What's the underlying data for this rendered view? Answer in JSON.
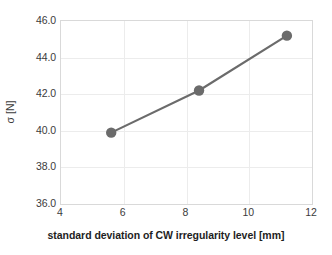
{
  "chart_data": {
    "type": "line",
    "title": "",
    "subtitle": "",
    "xlabel": "standard deviation of CW irregularity level [mm]",
    "ylabel": "σ [N]",
    "xlim": [
      4,
      12
    ],
    "ylim": [
      36.0,
      46.0
    ],
    "xticks": [
      "4",
      "6",
      "8",
      "10",
      "12"
    ],
    "xtick_values": [
      4,
      6,
      8,
      10,
      12
    ],
    "yticks": [
      "36.0",
      "38.0",
      "40.0",
      "42.0",
      "44.0",
      "46.0"
    ],
    "ytick_values": [
      36.0,
      38.0,
      40.0,
      42.0,
      44.0,
      46.0
    ],
    "grid": true,
    "legend": "none",
    "series": [
      {
        "name": "sigma vs CW irregularity",
        "x": [
          5.6,
          8.4,
          11.2
        ],
        "values": [
          39.9,
          42.2,
          45.2
        ],
        "color": "#6b6b6b",
        "marker": "circle",
        "line_width": 2.2,
        "marker_size": 5.2
      }
    ]
  },
  "axes": {
    "y_title": "σ [N]",
    "x_title": "standard deviation of CW irregularity level [mm]",
    "y_tick_labels": [
      "46.0",
      "44.0",
      "42.0",
      "40.0",
      "38.0",
      "36.0"
    ],
    "x_tick_labels": [
      "4",
      "6",
      "8",
      "10",
      "12"
    ]
  },
  "colors": {
    "series": "#6b6b6b",
    "grid": "#ececec",
    "frame": "#d9d9d9",
    "tick_text": "#3b3b3b",
    "axis_title": "#1e1e1e",
    "background": "#ffffff"
  }
}
